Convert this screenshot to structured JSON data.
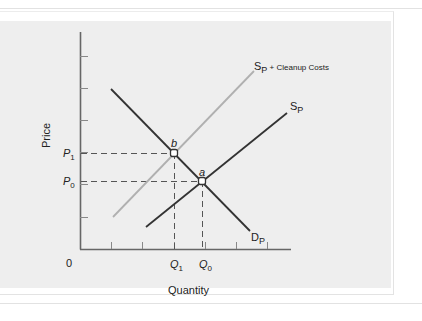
{
  "diagram": {
    "axes": {
      "x_label": "Quantity",
      "y_label": "Price",
      "origin_label": "0"
    },
    "price_labels": [
      {
        "base": "P",
        "sub": "1"
      },
      {
        "base": "P",
        "sub": "0"
      }
    ],
    "quantity_labels": [
      {
        "base": "Q",
        "sub": "1"
      },
      {
        "base": "Q",
        "sub": "0"
      }
    ],
    "curves": {
      "private_supply": {
        "base": "S",
        "sub": "P"
      },
      "social_supply": {
        "base": "S",
        "sub": "P",
        "suffix": " + Cleanup Costs"
      },
      "demand": {
        "base": "D",
        "sub": "P"
      }
    },
    "points": {
      "b": "b",
      "a": "a"
    },
    "colors": {
      "panel": "#eeeeee",
      "axis": "#666666",
      "demand": "#333333",
      "private_supply": "#333333",
      "social_supply": "#b0b0b0",
      "dash": "#555555"
    }
  }
}
